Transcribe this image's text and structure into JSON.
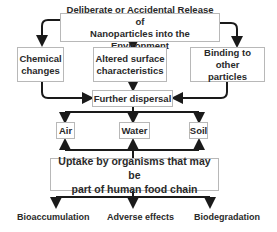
{
  "diagram": {
    "type": "flowchart",
    "nodes": {
      "release": "Deliberate or Accidental Release of Nanoparticles into the Environment",
      "release_line1": "Deliberate or Accidental Release of",
      "release_line2": "Nanoparticles into the Environment",
      "chemical_line1": "Chemical",
      "chemical_line2": "changes",
      "altered_line1": "Altered surface",
      "altered_line2": "characteristics",
      "binding_line1": "Binding to other",
      "binding_line2": "particles",
      "dispersal": "Further dispersal",
      "air": "Air",
      "water": "Water",
      "soil": "Soil",
      "uptake_line1": "Uptake by organisms that may be",
      "uptake_line2": "part of human food chain",
      "bioaccumulation": "Bioaccumulation",
      "adverse": "Adverse effects",
      "biodegradation": "Biodegradation"
    },
    "edges": [
      [
        "release",
        "chemical"
      ],
      [
        "release",
        "altered"
      ],
      [
        "release",
        "binding"
      ],
      [
        "chemical",
        "dispersal"
      ],
      [
        "altered",
        "dispersal"
      ],
      [
        "binding",
        "dispersal"
      ],
      [
        "dispersal",
        "air"
      ],
      [
        "dispersal",
        "water"
      ],
      [
        "dispersal",
        "soil"
      ],
      [
        "uptake",
        "air"
      ],
      [
        "uptake",
        "water"
      ],
      [
        "uptake",
        "soil"
      ],
      [
        "uptake",
        "bioaccumulation"
      ],
      [
        "uptake",
        "adverse"
      ],
      [
        "uptake",
        "biodegradation"
      ]
    ],
    "colors": {
      "line": "#1a1a1a",
      "box_border": "#b8b8b8",
      "text": "#2a2a2a"
    }
  }
}
